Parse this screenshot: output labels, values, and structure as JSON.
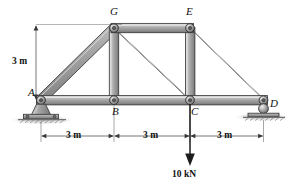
{
  "figure": {
    "type": "truss-diagram"
  },
  "joints": [
    {
      "id": "A",
      "label": "A",
      "x": 40,
      "y": 100,
      "support": "pin"
    },
    {
      "id": "B",
      "label": "B",
      "x": 114,
      "y": 100,
      "support": "none"
    },
    {
      "id": "C",
      "label": "C",
      "x": 190,
      "y": 100,
      "support": "none"
    },
    {
      "id": "D",
      "label": "D",
      "x": 264,
      "y": 100,
      "support": "roller"
    },
    {
      "id": "G",
      "label": "G",
      "x": 114,
      "y": 28,
      "support": "none"
    },
    {
      "id": "E",
      "label": "E",
      "x": 190,
      "y": 28,
      "support": "none"
    }
  ],
  "members": [
    {
      "from": "A",
      "to": "B"
    },
    {
      "from": "B",
      "to": "C"
    },
    {
      "from": "C",
      "to": "D"
    },
    {
      "from": "G",
      "to": "E"
    },
    {
      "from": "A",
      "to": "G"
    },
    {
      "from": "G",
      "to": "B"
    },
    {
      "from": "G",
      "to": "C"
    },
    {
      "from": "E",
      "to": "C"
    },
    {
      "from": "E",
      "to": "D"
    }
  ],
  "dimensions": {
    "vertical": {
      "text": "3 m",
      "value": 3,
      "unit": "m"
    },
    "horizontal": [
      {
        "text": "3 m",
        "value": 3,
        "unit": "m",
        "from": "A",
        "to": "B"
      },
      {
        "text": "3 m",
        "value": 3,
        "unit": "m",
        "from": "B",
        "to": "C"
      },
      {
        "text": "3 m",
        "value": 3,
        "unit": "m",
        "from": "C",
        "to": "D"
      }
    ]
  },
  "load": {
    "label": "10 kN",
    "magnitude": 10,
    "unit": "kN",
    "direction": "down",
    "at_joint": "C"
  },
  "colors": {
    "member_fill": "#9a9a9a",
    "member_light": "#d8d8d8",
    "member_dark": "#5f5f5f",
    "outline": "#2e2e2e",
    "ground": "#7d7d7d",
    "text": "#111111"
  }
}
